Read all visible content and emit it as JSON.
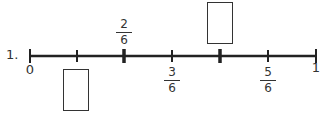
{
  "problem": {
    "number": "1.",
    "start_label": "0",
    "end_label": "1",
    "denominator": "6",
    "fractions": [
      {
        "id": "two-sixths",
        "num": "2",
        "den": "6",
        "position": "above"
      },
      {
        "id": "three-sixths",
        "num": "3",
        "den": "6",
        "position": "below"
      },
      {
        "id": "five-sixths",
        "num": "5",
        "den": "6",
        "position": "below"
      }
    ],
    "answer_boxes": [
      {
        "id": "one-sixth",
        "position": "below",
        "value": ""
      },
      {
        "id": "four-sixths",
        "position": "above",
        "value": ""
      }
    ]
  }
}
